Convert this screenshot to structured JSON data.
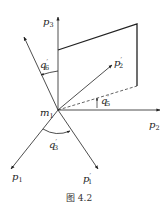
{
  "figure": {
    "caption": "图 4.2",
    "origin_label": {
      "base": "m",
      "sub": "1"
    },
    "vectors": [
      {
        "id": "p3",
        "base": "p",
        "sub": "3",
        "prime": ""
      },
      {
        "id": "p2",
        "base": "p",
        "sub": "2",
        "prime": ""
      },
      {
        "id": "p1",
        "base": "p",
        "sub": "1",
        "prime": ""
      },
      {
        "id": "p2prime",
        "base": "p",
        "sub": "2",
        "prime": "′"
      },
      {
        "id": "p1prime",
        "base": "p",
        "sub": "1",
        "prime": "′"
      }
    ],
    "angles": [
      {
        "id": "q6prime",
        "base": "q",
        "sub": "6",
        "prime": "′"
      },
      {
        "id": "q5prime",
        "base": "q",
        "sub": "5",
        "prime": "′"
      },
      {
        "id": "q3prime",
        "base": "q",
        "sub": "3",
        "prime": "′"
      }
    ],
    "colors": {
      "line": "#222222",
      "background": "#ffffff"
    }
  }
}
